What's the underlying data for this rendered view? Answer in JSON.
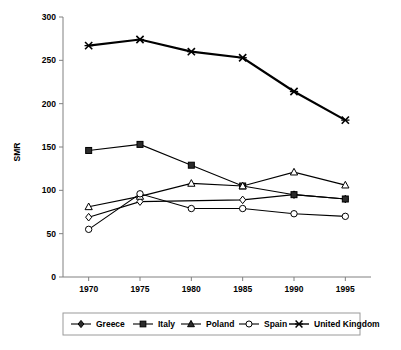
{
  "chart_data": {
    "type": "line",
    "title": "",
    "xlabel": "",
    "ylabel": "SMR",
    "x": [
      1970,
      1975,
      1980,
      1985,
      1990,
      1995
    ],
    "xticklabels": [
      "1970",
      "1975",
      "1980",
      "1985",
      "1990",
      "1995"
    ],
    "yticks": [
      0,
      50,
      100,
      150,
      200,
      250,
      300
    ],
    "yticklabels": [
      "0",
      "50",
      "100",
      "150",
      "200",
      "250",
      "300"
    ],
    "ylim": [
      0,
      300
    ],
    "xlim": [
      1967.5,
      1997.5
    ],
    "grid": false,
    "legend_position": "bottom",
    "series": [
      {
        "name": "Greece",
        "marker": "diamond",
        "marker_style": "open",
        "line_weight": "thin",
        "values": [
          69,
          87,
          null,
          89,
          95,
          90
        ]
      },
      {
        "name": "Italy",
        "marker": "square",
        "marker_style": "filled",
        "line_weight": "thin",
        "values": [
          146,
          153,
          129,
          105,
          95,
          90
        ]
      },
      {
        "name": "Poland",
        "marker": "triangle",
        "marker_style": "open",
        "line_weight": "thin",
        "values": [
          81,
          93,
          108,
          105,
          121,
          106
        ]
      },
      {
        "name": "Spain",
        "marker": "circle",
        "marker_style": "open",
        "line_weight": "thin",
        "values": [
          55,
          96,
          79,
          79,
          73,
          70
        ]
      },
      {
        "name": "United Kingdom",
        "marker": "cross",
        "marker_style": "filled",
        "line_weight": "thick",
        "values": [
          267,
          274,
          260,
          253,
          214,
          181
        ]
      }
    ]
  },
  "legend": {
    "items": [
      {
        "label": "Greece",
        "marker": "diamond"
      },
      {
        "label": "Italy",
        "marker": "square"
      },
      {
        "label": "Poland",
        "marker": "triangle"
      },
      {
        "label": "Spain",
        "marker": "circle"
      },
      {
        "label": "United Kingdom",
        "marker": "cross"
      }
    ]
  },
  "axis": {
    "y_title": "SMR"
  }
}
